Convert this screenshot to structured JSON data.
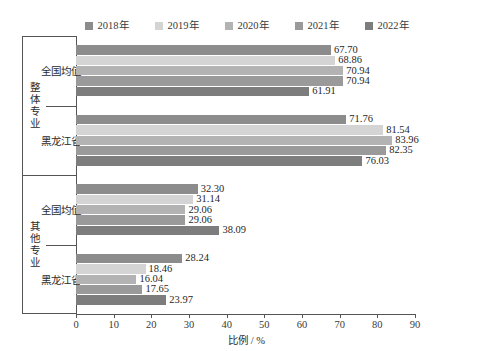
{
  "chart_data": {
    "type": "bar",
    "orientation": "horizontal",
    "title": "",
    "xlabel": "比例 / %",
    "ylabel": "",
    "xlim": [
      0,
      90
    ],
    "xticks": [
      0,
      10,
      20,
      30,
      40,
      50,
      60,
      70,
      80,
      90
    ],
    "grid": false,
    "legend_position": "top-center",
    "legend": [
      "2018年",
      "2019年",
      "2020年",
      "2021年",
      "2022年"
    ],
    "series": [
      {
        "name": "2018年",
        "color": "#8c8c8c",
        "values": [
          67.7,
          71.76,
          32.3,
          28.24
        ]
      },
      {
        "name": "2019年",
        "color": "#d4d4d4",
        "values": [
          68.86,
          81.54,
          31.14,
          18.46
        ]
      },
      {
        "name": "2020年",
        "color": "#b3b3b3",
        "values": [
          70.94,
          83.96,
          29.06,
          16.04
        ]
      },
      {
        "name": "2021年",
        "color": "#9a9a9a",
        "values": [
          70.94,
          82.35,
          29.06,
          17.65
        ]
      },
      {
        "name": "2022年",
        "color": "#7d7d7d",
        "values": [
          61.91,
          76.03,
          38.09,
          23.97
        ]
      }
    ],
    "categories": [
      "全国均值",
      "黑龙江省",
      "全国均值",
      "黑龙江省"
    ],
    "super_categories": [
      {
        "label": "整体专业",
        "members": [
          "全国均值",
          "黑龙江省"
        ]
      },
      {
        "label": "其他专业",
        "members": [
          "全国均值",
          "黑龙江省"
        ]
      }
    ],
    "groups": [
      {
        "super": "整体专业",
        "category": "全国均值",
        "bars": [
          {
            "series": "2018年",
            "value": 67.7,
            "label": "67.70"
          },
          {
            "series": "2019年",
            "value": 68.86,
            "label": "68.86"
          },
          {
            "series": "2020年",
            "value": 70.94,
            "label": "70.94"
          },
          {
            "series": "2021年",
            "value": 70.94,
            "label": "70.94"
          },
          {
            "series": "2022年",
            "value": 61.91,
            "label": "61.91"
          }
        ]
      },
      {
        "super": "整体专业",
        "category": "黑龙江省",
        "bars": [
          {
            "series": "2018年",
            "value": 71.76,
            "label": "71.76"
          },
          {
            "series": "2019年",
            "value": 81.54,
            "label": "81.54"
          },
          {
            "series": "2020年",
            "value": 83.96,
            "label": "83.96"
          },
          {
            "series": "2021年",
            "value": 82.35,
            "label": "82.35"
          },
          {
            "series": "2022年",
            "value": 76.03,
            "label": "76.03"
          }
        ]
      },
      {
        "super": "其他专业",
        "category": "全国均值",
        "bars": [
          {
            "series": "2018年",
            "value": 32.3,
            "label": "32.30"
          },
          {
            "series": "2019年",
            "value": 31.14,
            "label": "31.14"
          },
          {
            "series": "2020年",
            "value": 29.06,
            "label": "29.06"
          },
          {
            "series": "2021年",
            "value": 29.06,
            "label": "29.06"
          },
          {
            "series": "2022年",
            "value": 38.09,
            "label": "38.09"
          }
        ]
      },
      {
        "super": "其他专业",
        "category": "黑龙江省",
        "bars": [
          {
            "series": "2018年",
            "value": 28.24,
            "label": "28.24"
          },
          {
            "series": "2019年",
            "value": 18.46,
            "label": "18.46"
          },
          {
            "series": "2020年",
            "value": 16.04,
            "label": "16.04"
          },
          {
            "series": "2021年",
            "value": 17.65,
            "label": "17.65"
          },
          {
            "series": "2022年",
            "value": 23.97,
            "label": "23.97"
          }
        ]
      }
    ]
  },
  "axis": {
    "x_tick_labels": [
      "0",
      "10",
      "20",
      "30",
      "40",
      "50",
      "60",
      "70",
      "80",
      "90"
    ],
    "x_title": "比例 / %"
  },
  "colors": {
    "axis_line": "#555555",
    "text": "#262626",
    "background": "#ffffff"
  }
}
